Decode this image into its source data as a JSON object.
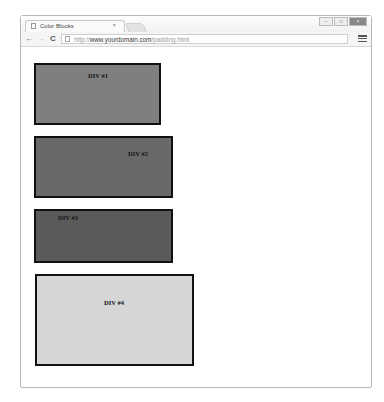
{
  "browser": {
    "tab": {
      "title": "Color Blocks",
      "close": "×"
    },
    "window_controls": {
      "minimize": "–",
      "maximize": "□",
      "close": "×"
    },
    "nav": {
      "back": "←",
      "forward": "→",
      "reload": "C"
    },
    "address": {
      "scheme": "http://",
      "domain": "www.yourdomain.com",
      "path": "/padding.html"
    }
  },
  "blocks": [
    {
      "label": "DIV #1",
      "color": "#7f7f7f"
    },
    {
      "label": "DIV #2",
      "color": "#696969"
    },
    {
      "label": "DIV #3",
      "color": "#5a5a5a"
    },
    {
      "label": "DIV #4",
      "color": "#d6d6d6"
    }
  ]
}
